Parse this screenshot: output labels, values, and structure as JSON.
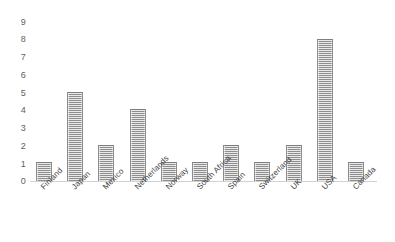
{
  "chart_data": {
    "type": "bar",
    "title": "",
    "subtitle": "",
    "xlabel": "",
    "ylabel": "",
    "categories": [
      "Finland",
      "Japan",
      "Mexico",
      "Netherlands",
      "Norway",
      "South Africa",
      "Spain",
      "Switzerland",
      "UK",
      "USA",
      "Canada"
    ],
    "values": [
      1,
      5,
      2,
      4,
      1,
      1,
      2,
      1,
      2,
      8,
      1
    ],
    "ylim": [
      0,
      9
    ],
    "y_ticks": [
      "0",
      "1",
      "2",
      "3",
      "4",
      "5",
      "6",
      "7",
      "8",
      "9"
    ],
    "grid": false,
    "legend": false,
    "legend_position": "none",
    "bar_color": "#a8a8a8",
    "axis_color": "#d2d2d2",
    "tick_label_color": "#5e5e5e",
    "category_label_color": "#3f3f3f"
  }
}
